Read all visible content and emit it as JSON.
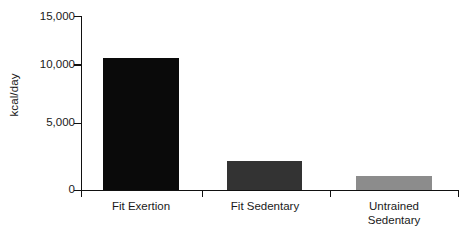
{
  "chart_data": {
    "type": "bar",
    "title": "",
    "xlabel": "",
    "ylabel": "kcal/day",
    "categories": [
      "Fit Exertion",
      "Fit Sedentary",
      "Untrained\nSedentary"
    ],
    "values": [
      11400,
      2500,
      1200
    ],
    "ylim": [
      0,
      15000
    ],
    "yticks": [
      0,
      5000,
      10000,
      15000
    ],
    "ytick_labels": [
      "0",
      "5,000",
      "10,000",
      "15,000"
    ],
    "bar_colors": [
      "#0a0a0a",
      "#333333",
      "#8c8c8c"
    ],
    "grid": false,
    "legend": false
  },
  "axis": {
    "line_color": "#111111"
  }
}
